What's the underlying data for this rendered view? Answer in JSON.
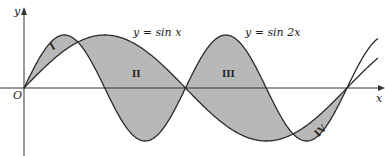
{
  "axes": {
    "x_label": "x",
    "y_label": "y",
    "origin_label": "O"
  },
  "curves": [
    {
      "name": "sin",
      "label": "y = sin x"
    },
    {
      "name": "sin2",
      "label": "y = sin 2x"
    }
  ],
  "regions": [
    "I",
    "II",
    "III",
    "IV"
  ],
  "colors": {
    "fill": "#b8b8b8",
    "stroke": "#2a2a2a"
  }
}
